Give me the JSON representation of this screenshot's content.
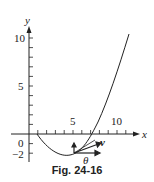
{
  "figure": {
    "caption": "Fig. 24-16",
    "axes": {
      "x_label": "x",
      "y_label": "y",
      "x_ticks": [
        "5",
        "10"
      ],
      "y_ticks": [
        "10",
        "5",
        "0",
        "−2"
      ]
    },
    "annotations": {
      "vector_label": "v",
      "angle_label": "θ"
    },
    "colors": {
      "ink": "#222222",
      "background": "#ffffff"
    }
  }
}
